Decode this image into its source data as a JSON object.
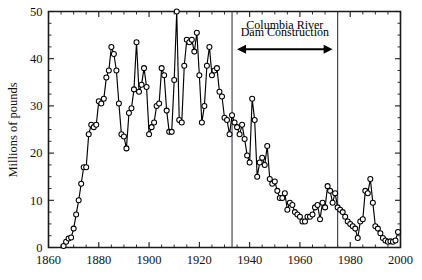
{
  "chart_data": {
    "type": "line",
    "title": "",
    "subtitle": "",
    "xlabel": "",
    "ylabel": "Millions of pounds",
    "xlim": [
      1860,
      2000
    ],
    "ylim": [
      0,
      50
    ],
    "xticks": [
      1860,
      1880,
      1900,
      1920,
      1940,
      1960,
      1980,
      2000
    ],
    "xtick_labels": [
      "1860",
      "1880",
      "1900",
      "1920",
      "1940",
      "1960",
      "1980",
      "2000"
    ],
    "yticks": [
      0,
      10,
      20,
      30,
      40,
      50
    ],
    "ytick_labels": [
      "0",
      "10",
      "20",
      "30",
      "40",
      "50"
    ],
    "x_minor_tick_step": 5,
    "y_minor_tick_step": 2.5,
    "grid": false,
    "legend": null,
    "marker": "open-circle",
    "line_color": "#000000",
    "marker_face_color": "#ffffff",
    "marker_edge_color": "#000000",
    "annotations": [
      {
        "name": "columbia-river-dam-construction",
        "text_line_1": "Columbia River",
        "text_line_2": "Dam Construction",
        "arrow": "double-headed",
        "x_start": 1933,
        "x_end": 1975,
        "y_text": 47.5,
        "y_arrow": 42.0
      }
    ],
    "vertical_lines": [
      {
        "name": "dam-construction-start",
        "x": 1933
      },
      {
        "name": "dam-construction-end",
        "x": 1975
      }
    ],
    "series": [
      {
        "name": "Columbia River salmon landings",
        "x": [
          1866,
          1867,
          1868,
          1869,
          1870,
          1871,
          1872,
          1873,
          1874,
          1875,
          1876,
          1877,
          1878,
          1879,
          1880,
          1881,
          1882,
          1883,
          1884,
          1885,
          1886,
          1887,
          1888,
          1889,
          1890,
          1891,
          1892,
          1893,
          1894,
          1895,
          1896,
          1897,
          1898,
          1899,
          1900,
          1901,
          1902,
          1903,
          1904,
          1905,
          1906,
          1907,
          1908,
          1909,
          1910,
          1911,
          1912,
          1913,
          1914,
          1915,
          1916,
          1917,
          1918,
          1919,
          1920,
          1921,
          1922,
          1923,
          1924,
          1925,
          1926,
          1927,
          1928,
          1929,
          1930,
          1931,
          1932,
          1933,
          1934,
          1935,
          1936,
          1937,
          1938,
          1939,
          1940,
          1941,
          1942,
          1943,
          1944,
          1945,
          1946,
          1947,
          1948,
          1949,
          1950,
          1951,
          1952,
          1953,
          1954,
          1955,
          1956,
          1957,
          1958,
          1959,
          1960,
          1961,
          1962,
          1963,
          1964,
          1965,
          1966,
          1967,
          1968,
          1969,
          1970,
          1971,
          1972,
          1973,
          1974,
          1975,
          1976,
          1977,
          1978,
          1979,
          1980,
          1981,
          1982,
          1983,
          1984,
          1985,
          1986,
          1987,
          1988,
          1989,
          1990,
          1991,
          1992,
          1993,
          1994,
          1995,
          1996,
          1997,
          1998,
          1999
        ],
        "values": [
          0.3,
          1.2,
          1.9,
          2.1,
          4.0,
          7.0,
          10.0,
          13.5,
          17.0,
          17.0,
          24.0,
          26.0,
          25.5,
          26.0,
          31.0,
          30.5,
          31.5,
          36.0,
          37.5,
          42.5,
          41.0,
          37.5,
          30.5,
          24.0,
          23.5,
          21.0,
          28.5,
          29.5,
          33.5,
          43.5,
          33.0,
          34.5,
          38.0,
          34.0,
          24.0,
          25.5,
          26.5,
          30.0,
          30.5,
          38.0,
          36.5,
          29.0,
          24.5,
          24.5,
          35.5,
          50.0,
          27.0,
          26.5,
          38.5,
          44.0,
          43.5,
          44.0,
          41.5,
          45.5,
          36.5,
          26.5,
          30.0,
          38.5,
          42.5,
          36.5,
          37.5,
          38.0,
          33.0,
          32.0,
          27.5,
          27.0,
          24.0,
          28.0,
          26.5,
          25.5,
          24.0,
          26.0,
          23.0,
          19.5,
          18.0,
          31.5,
          27.0,
          15.0,
          18.0,
          19.0,
          17.5,
          21.5,
          14.5,
          13.5,
          14.0,
          12.0,
          10.5,
          10.5,
          11.5,
          8.0,
          9.5,
          9.0,
          7.5,
          7.0,
          6.5,
          5.5,
          5.5,
          6.5,
          6.5,
          7.0,
          8.5,
          9.0,
          6.0,
          9.5,
          8.5,
          13.0,
          12.0,
          9.5,
          11.5,
          8.5,
          8.0,
          7.5,
          6.5,
          5.5,
          5.0,
          4.5,
          4.0,
          2.0,
          5.5,
          6.0,
          12.0,
          11.5,
          14.5,
          9.5,
          4.5,
          4.0,
          3.0,
          2.0,
          1.5,
          1.2,
          1.3,
          1.2,
          1.5,
          3.3
        ]
      }
    ]
  },
  "figure": {
    "background_color": "#ffffff",
    "axis_color": "#1a1a1a"
  }
}
